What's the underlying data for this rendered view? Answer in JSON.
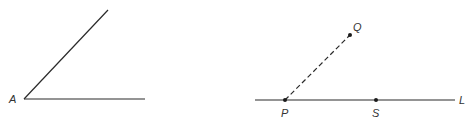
{
  "figure_left": {
    "vertex_label": "A",
    "vertex": [
      24,
      99
    ],
    "ray_horizontal_end": [
      145,
      99
    ],
    "ray_diagonal_end": [
      108,
      10
    ]
  },
  "figure_right": {
    "line_label": "L",
    "line_start": [
      255,
      100
    ],
    "line_end": [
      455,
      100
    ],
    "points": [
      {
        "label": "P",
        "x": 285,
        "y": 100
      },
      {
        "label": "S",
        "x": 376,
        "y": 100
      },
      {
        "label": "Q",
        "x": 350,
        "y": 35
      }
    ],
    "dashed_segment": {
      "from": "P",
      "to": "Q"
    }
  },
  "colors": {
    "line": "#2a2a2a",
    "label": "#333333"
  }
}
